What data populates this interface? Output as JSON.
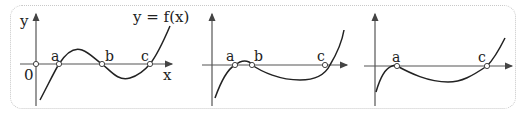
{
  "diagram": {
    "panels": [
      {
        "id": "panel-1",
        "y_axis_label": "y",
        "x_axis_label": "x",
        "origin_label": "0",
        "function_label": "y = f(x)",
        "roots": [
          "a",
          "b",
          "c"
        ]
      },
      {
        "id": "panel-2",
        "roots": [
          "a",
          "b",
          "c"
        ]
      },
      {
        "id": "panel-3",
        "roots": [
          "a",
          "c"
        ]
      }
    ]
  },
  "colors": {
    "curve": "#222222",
    "axis": "#555555",
    "border": "#c8c8c8"
  }
}
